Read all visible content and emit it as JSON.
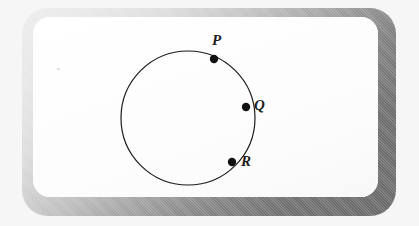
{
  "figure": {
    "kind": "geometry-diagram",
    "shape": "circle",
    "frame": {
      "style": "rounded-rectangle-beveled",
      "highlight_color": "#ededed",
      "shadow_color": "#686868"
    },
    "background_color": "#f6f6f6",
    "panel_color": "#ffffff",
    "stroke_color": "#1c1c1c"
  },
  "circle": {
    "center_x": 188,
    "center_y": 118,
    "radius": 67,
    "stroke_width": 1.2
  },
  "points": [
    {
      "id": "P",
      "label": "P",
      "cx": 214,
      "cy": 59,
      "dot_radius": 4.2,
      "label_x": 212,
      "label_y": 33
    },
    {
      "id": "Q",
      "label": "Q",
      "cx": 246,
      "cy": 107,
      "dot_radius": 4.2,
      "label_x": 254,
      "label_y": 98
    },
    {
      "id": "R",
      "label": "R",
      "cx": 232,
      "cy": 162,
      "dot_radius": 4.2,
      "label_x": 241,
      "label_y": 154
    }
  ]
}
